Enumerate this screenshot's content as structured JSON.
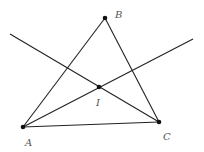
{
  "diagram": {
    "title": "",
    "points": {
      "A": {
        "label": "A",
        "x": 23,
        "y": 127
      },
      "B": {
        "label": "B",
        "x": 105,
        "y": 18
      },
      "C": {
        "label": "C",
        "x": 159,
        "y": 122
      },
      "I": {
        "label": "I",
        "x": 99,
        "y": 87
      }
    },
    "line_color": "#222222",
    "label_color": "#555555"
  }
}
